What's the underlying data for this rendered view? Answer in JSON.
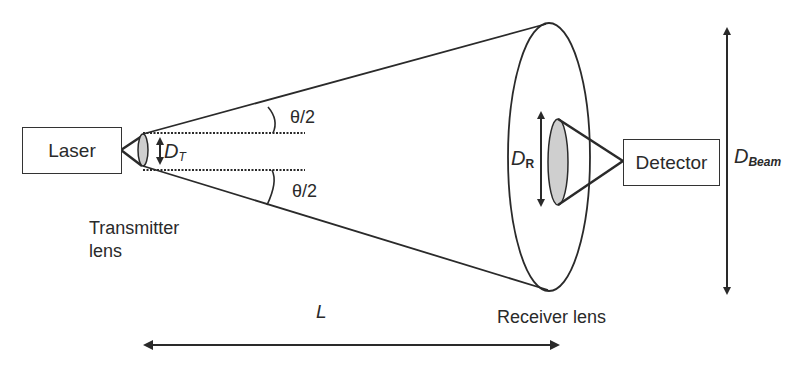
{
  "diagram": {
    "components": {
      "laser": {
        "label": "Laser"
      },
      "detector": {
        "label": "Detector"
      },
      "transmitter_lens": {
        "label_line1": "Transmitter",
        "label_line2": "lens"
      },
      "receiver_lens": {
        "label": "Receiver lens"
      }
    },
    "symbols": {
      "dt_main": "D",
      "dt_sub": "T",
      "dr_main": "D",
      "dr_sub": "R",
      "dbeam_main": "D",
      "dbeam_sub": "Beam",
      "theta_upper": "θ/2",
      "theta_lower": "θ/2",
      "length": "L"
    },
    "colors": {
      "stroke": "#2a2a2a",
      "lens_fill": "#cfcfcf",
      "background": "#ffffff"
    }
  }
}
